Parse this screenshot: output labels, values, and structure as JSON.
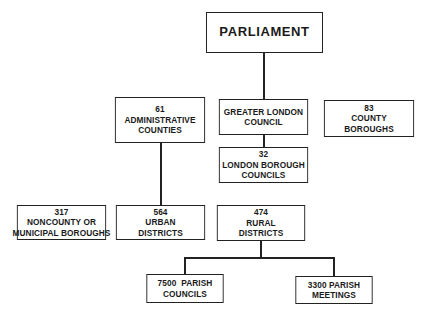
{
  "diagram": {
    "type": "organization-chart",
    "nodes": {
      "parliament": {
        "lines": [
          "PARLIAMENT"
        ]
      },
      "administrative_counties": {
        "lines": [
          "61",
          "ADMINISTRATIVE",
          "COUNTIES"
        ]
      },
      "greater_london_council": {
        "lines": [
          "GREATER LONDON",
          "COUNCIL"
        ]
      },
      "county_boroughs": {
        "lines": [
          "83",
          "COUNTY",
          "BOROUGHS"
        ]
      },
      "london_borough_councils": {
        "lines": [
          "32",
          "LONDON BOROUGH",
          "COUNCILS"
        ]
      },
      "noncounty_boroughs": {
        "lines": [
          "317",
          "NONCOUNTY OR",
          "MUNICIPAL BOROUGHS"
        ]
      },
      "urban_districts": {
        "lines": [
          "564",
          "URBAN",
          "DISTRICTS"
        ]
      },
      "rural_districts": {
        "lines": [
          "474",
          "RURAL",
          "DISTRICTS"
        ]
      },
      "parish_councils": {
        "lines": [
          "7500  PARISH",
          "COUNCILS"
        ]
      },
      "parish_meetings": {
        "lines": [
          "3300 PARISH",
          "MEETINGS"
        ]
      }
    },
    "edges": [
      [
        "parliament",
        "greater_london_council"
      ],
      [
        "greater_london_council",
        "london_borough_councils"
      ],
      [
        "administrative_counties",
        "urban_districts"
      ],
      [
        "rural_districts",
        "parish_councils"
      ],
      [
        "rural_districts",
        "parish_meetings"
      ]
    ],
    "colors": {
      "line": "#222222",
      "background": "#ffffff",
      "text": "#1a1a1a"
    }
  }
}
